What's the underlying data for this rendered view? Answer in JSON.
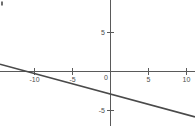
{
  "chart_data": {
    "type": "line",
    "title": "",
    "subtitle": "",
    "xlabel": "",
    "ylabel": "",
    "xlim": [
      -14.3,
      11.0
    ],
    "ylim": [
      -7.8,
      9.2
    ],
    "grid": false,
    "legend": null,
    "series": [
      {
        "name": "line",
        "color": "#4a4a4a",
        "slope": -0.27,
        "intercept": -3,
        "equation": "y = -0.27x - 3",
        "x": [
          -14.3,
          -11.0,
          -5.0,
          0,
          5.0,
          11.0
        ],
        "y": [
          0.86,
          0,
          -1.65,
          -3,
          -4.35,
          -5.97
        ],
        "points": [
          {
            "x": -11.0,
            "y": 0
          },
          {
            "x": 0,
            "y": -3
          },
          {
            "x": 5.0,
            "y": -4.35
          }
        ]
      }
    ],
    "x_ticks": [
      {
        "value": -10,
        "label": "-10"
      },
      {
        "value": -5,
        "label": "-5"
      },
      {
        "value": 0,
        "label": "0"
      },
      {
        "value": 5,
        "label": "5"
      },
      {
        "value": 10,
        "label": "10"
      }
    ],
    "y_ticks": [
      {
        "value": 5,
        "label": "5"
      },
      {
        "value": -5,
        "label": "-5"
      }
    ],
    "axes": {
      "x_axis_label": "",
      "y_axis_label": "",
      "origin_label": "0",
      "axis_color": "#5a5a5a"
    }
  },
  "figure": {
    "background_color": "#ffffff",
    "width": 195,
    "height": 131,
    "corner_mark": "·"
  }
}
